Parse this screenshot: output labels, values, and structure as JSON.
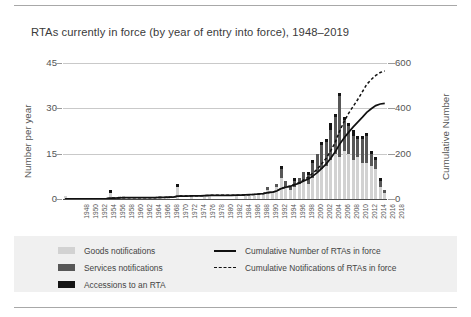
{
  "chart_data": {
    "type": "bar",
    "title": "RTAs currently in force (by year of entry into force), 1948–2019",
    "xlabel": "",
    "ylabel": "Number per year",
    "ylabel_right": "Cumulative Number",
    "ylim": [
      0,
      45
    ],
    "ylim_right": [
      0,
      600
    ],
    "yticks": [
      "0",
      "15",
      "30",
      "45"
    ],
    "yticks_right": [
      "0",
      "200",
      "400",
      "600"
    ],
    "grid": true,
    "legend_position": "bottom",
    "stacked": true,
    "x": [
      1948,
      1949,
      1950,
      1951,
      1952,
      1953,
      1954,
      1955,
      1956,
      1957,
      1958,
      1959,
      1960,
      1961,
      1962,
      1963,
      1964,
      1965,
      1966,
      1967,
      1968,
      1969,
      1970,
      1971,
      1972,
      1973,
      1974,
      1975,
      1976,
      1977,
      1978,
      1979,
      1980,
      1981,
      1982,
      1983,
      1984,
      1985,
      1986,
      1987,
      1988,
      1989,
      1990,
      1991,
      1992,
      1993,
      1994,
      1995,
      1996,
      1997,
      1998,
      1999,
      2000,
      2001,
      2002,
      2003,
      2004,
      2005,
      2006,
      2007,
      2008,
      2009,
      2010,
      2011,
      2012,
      2013,
      2014,
      2015,
      2016,
      2017,
      2018,
      2019
    ],
    "xtick_labels": [
      "1948",
      "1950",
      "1952",
      "1954",
      "1956",
      "1958",
      "1960",
      "1962",
      "1964",
      "1966",
      "1968",
      "1970",
      "1972",
      "1974",
      "1976",
      "1978",
      "1980",
      "1982",
      "1984",
      "1986",
      "1988",
      "1990",
      "1992",
      "1994",
      "1996",
      "1998",
      "2000",
      "2002",
      "2004",
      "2006",
      "2008",
      "2010",
      "2012",
      "2014",
      "2016",
      "2018"
    ],
    "series": [
      {
        "name": "Goods notifications",
        "color": "#d2d2d2",
        "values": [
          1,
          0,
          0,
          0,
          0,
          0,
          0,
          0,
          0,
          0,
          2,
          0,
          1,
          1,
          0,
          0,
          0,
          0,
          0,
          0,
          0,
          1,
          0,
          1,
          0,
          4,
          0,
          0,
          1,
          0,
          0,
          1,
          1,
          0,
          0,
          0,
          0,
          0,
          1,
          0,
          1,
          1,
          1,
          2,
          2,
          3,
          2,
          4,
          7,
          4,
          3,
          4,
          5,
          6,
          5,
          7,
          9,
          10,
          11,
          13,
          15,
          14,
          16,
          15,
          13,
          14,
          12,
          12,
          11,
          10,
          4,
          2
        ]
      },
      {
        "name": "Services notifications",
        "color": "#575757",
        "values": [
          0,
          0,
          0,
          0,
          0,
          0,
          0,
          0,
          0,
          0,
          0,
          0,
          0,
          0,
          0,
          0,
          0,
          0,
          0,
          0,
          0,
          0,
          0,
          0,
          0,
          0,
          0,
          0,
          0,
          0,
          0,
          0,
          0,
          0,
          0,
          0,
          0,
          0,
          0,
          0,
          0,
          0,
          0,
          0,
          0,
          1,
          0,
          1,
          3,
          2,
          1,
          2,
          2,
          3,
          3,
          5,
          6,
          8,
          8,
          10,
          12,
          20,
          10,
          9,
          8,
          6,
          8,
          9,
          4,
          3,
          2,
          1
        ]
      },
      {
        "name": "Accessions to an RTA",
        "color": "#141414",
        "values": [
          0,
          0,
          0,
          0,
          0,
          0,
          0,
          0,
          0,
          0,
          1,
          0,
          0,
          0,
          0,
          0,
          0,
          0,
          0,
          0,
          0,
          0,
          0,
          0,
          0,
          1,
          0,
          0,
          0,
          0,
          0,
          0,
          0,
          0,
          0,
          0,
          0,
          0,
          0,
          0,
          0,
          0,
          0,
          0,
          0,
          0,
          0,
          0,
          1,
          0,
          0,
          1,
          0,
          0,
          1,
          1,
          0,
          1,
          1,
          2,
          1,
          1,
          1,
          1,
          2,
          1,
          1,
          1,
          1,
          1,
          1,
          0
        ]
      }
    ],
    "lines": [
      {
        "name": "Cumulative Number of RTAs in force",
        "style": "solid",
        "color": "#111111",
        "axis": "right",
        "values": [
          1,
          1,
          1,
          1,
          1,
          1,
          1,
          1,
          1,
          1,
          4,
          4,
          5,
          6,
          6,
          6,
          6,
          6,
          6,
          6,
          6,
          7,
          7,
          8,
          8,
          13,
          13,
          13,
          14,
          14,
          14,
          15,
          16,
          16,
          16,
          16,
          16,
          16,
          17,
          17,
          18,
          19,
          20,
          22,
          24,
          28,
          30,
          35,
          46,
          52,
          56,
          63,
          70,
          79,
          88,
          101,
          116,
          135,
          155,
          180,
          208,
          243,
          270,
          295,
          318,
          339,
          360,
          382,
          398,
          412,
          419,
          422
        ]
      },
      {
        "name": "Cumulative Notifications of RTAs in force",
        "style": "dashed",
        "color": "#111111",
        "axis": "right",
        "values": [
          1,
          1,
          1,
          1,
          1,
          1,
          1,
          1,
          1,
          1,
          4,
          4,
          5,
          6,
          6,
          6,
          6,
          6,
          6,
          6,
          6,
          7,
          7,
          8,
          8,
          13,
          13,
          13,
          14,
          14,
          14,
          15,
          16,
          16,
          16,
          16,
          16,
          16,
          17,
          17,
          18,
          19,
          20,
          22,
          24,
          28,
          30,
          35,
          47,
          53,
          57,
          65,
          72,
          84,
          96,
          114,
          131,
          156,
          180,
          213,
          250,
          301,
          343,
          379,
          409,
          439,
          472,
          506,
          527,
          545,
          558,
          565
        ]
      }
    ]
  },
  "legend": {
    "items": [
      {
        "label": "Goods notifications",
        "kind": "swatch",
        "key": "goods"
      },
      {
        "label": "Services notifications",
        "kind": "swatch",
        "key": "services"
      },
      {
        "label": "Accessions to an RTA",
        "kind": "swatch",
        "key": "accessions"
      },
      {
        "label": "Cumulative Number of RTAs in force",
        "kind": "line-solid",
        "key": "cum-number"
      },
      {
        "label": "Cumulative Notifications of RTAs in force",
        "kind": "line-dashed",
        "key": "cum-notifications"
      }
    ]
  }
}
